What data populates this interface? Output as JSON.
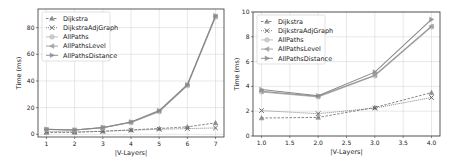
{
  "chart_data": [
    {
      "type": "line",
      "title": "",
      "xlabel": "|V-Layers|",
      "ylabel": "Time (ms)",
      "x": [
        1,
        2,
        3,
        4,
        5,
        6,
        7
      ],
      "xticks": [
        "1",
        "2",
        "3",
        "4",
        "5",
        "6",
        "7"
      ],
      "yticks": [
        "0",
        "20",
        "40",
        "60",
        "80"
      ],
      "xlim": [
        0.7,
        7.3
      ],
      "ylim": [
        -2,
        94
      ],
      "grid": true,
      "legend_position": "upper left",
      "series": [
        {
          "name": "Dijkstra",
          "marker": "triangle-up",
          "linestyle": "dashed",
          "values": [
            1.4,
            1.5,
            2.3,
            3.3,
            4.4,
            5.6,
            8.6
          ]
        },
        {
          "name": "DijkstraAdjGraph",
          "marker": "x",
          "linestyle": "dotted",
          "values": [
            2.0,
            1.8,
            2.3,
            3.1,
            3.8,
            4.3,
            4.8
          ]
        },
        {
          "name": "AllPaths",
          "marker": "circle",
          "linestyle": "solid",
          "values": [
            3.6,
            3.2,
            4.9,
            8.9,
            17.0,
            36.5,
            88.0
          ]
        },
        {
          "name": "AllPathsLevel",
          "marker": "triangle-left",
          "linestyle": "solid",
          "values": [
            3.7,
            3.2,
            5.0,
            9.0,
            17.3,
            37.0,
            88.5
          ]
        },
        {
          "name": "AllPathsDistance",
          "marker": "triangle-right",
          "linestyle": "solid",
          "values": [
            3.8,
            3.3,
            5.1,
            9.3,
            17.8,
            37.2,
            89.0
          ]
        }
      ]
    },
    {
      "type": "line",
      "title": "",
      "xlabel": "|V-Layers|",
      "ylabel": "Time (ms)",
      "x": [
        1.0,
        2.0,
        3.0,
        4.0
      ],
      "xticks": [
        "1.0",
        "1.5",
        "2.0",
        "2.5",
        "3.0",
        "3.5",
        "4.0"
      ],
      "yticks": [
        "0",
        "2",
        "4",
        "6",
        "8",
        "10"
      ],
      "xlim": [
        0.85,
        4.15
      ],
      "ylim": [
        0,
        10
      ],
      "grid": true,
      "legend_position": "upper left",
      "series": [
        {
          "name": "Dijkstra",
          "marker": "triangle-up",
          "linestyle": "dashed",
          "values": [
            1.45,
            1.5,
            2.3,
            3.5
          ]
        },
        {
          "name": "DijkstraAdjGraph",
          "marker": "x",
          "linestyle": "dotted",
          "values": [
            2.05,
            1.8,
            2.25,
            3.1
          ]
        },
        {
          "name": "AllPaths",
          "marker": "circle",
          "linestyle": "solid",
          "values": [
            3.55,
            3.15,
            4.85,
            8.8
          ]
        },
        {
          "name": "AllPathsLevel",
          "marker": "triangle-left",
          "linestyle": "solid",
          "values": [
            3.6,
            3.2,
            4.9,
            8.85
          ]
        },
        {
          "name": "AllPathsDistance",
          "marker": "triangle-right",
          "linestyle": "solid",
          "values": [
            3.75,
            3.25,
            5.15,
            9.4
          ]
        }
      ]
    }
  ],
  "series_colors": {
    "Dijkstra": "#777777",
    "DijkstraAdjGraph": "#666666",
    "AllPaths": "#bbbbbb",
    "AllPathsLevel": "#999999",
    "AllPathsDistance": "#888888"
  }
}
